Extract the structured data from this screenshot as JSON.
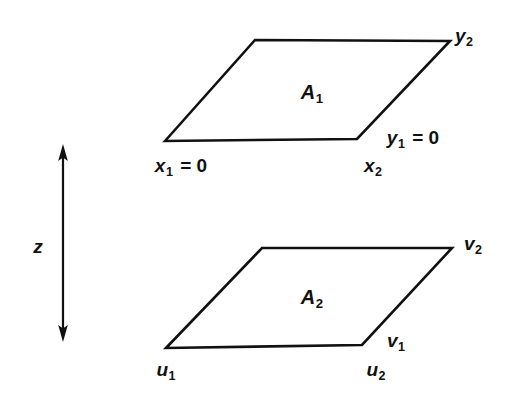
{
  "figure": {
    "type": "geometric-diagram",
    "background_color": "#ffffff",
    "stroke_color": "#111111",
    "text_color": "#111111"
  },
  "axis": {
    "name": "z",
    "label": "z",
    "style": "double-headed-vertical-arrow"
  },
  "planes": [
    {
      "id": "upper",
      "area_label": "A",
      "area_subscript": "1",
      "corner_labels": {
        "bottom_left": {
          "base": "x",
          "sub": "1",
          "suffix": " = 0"
        },
        "bottom_right": {
          "base": "x",
          "sub": "2",
          "suffix": ""
        },
        "right_edge": {
          "base": "y",
          "sub": "1",
          "suffix": " = 0"
        },
        "top_right": {
          "base": "y",
          "sub": "2",
          "suffix": ""
        }
      }
    },
    {
      "id": "lower",
      "area_label": "A",
      "area_subscript": "2",
      "corner_labels": {
        "bottom_left": {
          "base": "u",
          "sub": "1",
          "suffix": ""
        },
        "bottom_right": {
          "base": "u",
          "sub": "2",
          "suffix": ""
        },
        "right_edge": {
          "base": "v",
          "sub": "1",
          "suffix": ""
        },
        "top_right": {
          "base": "v",
          "sub": "2",
          "suffix": ""
        }
      }
    }
  ],
  "labels": {
    "a1_base": "A",
    "a1_sub": "1",
    "a2_base": "A",
    "a2_sub": "2",
    "x1_base": "x",
    "x1_sub": "1",
    "x1_suffix": " = 0",
    "x2_base": "x",
    "x2_sub": "2",
    "y1_base": "y",
    "y1_sub": "1",
    "y1_suffix": " = 0",
    "y2_base": "y",
    "y2_sub": "2",
    "u1_base": "u",
    "u1_sub": "1",
    "u2_base": "u",
    "u2_sub": "2",
    "v1_base": "v",
    "v1_sub": "1",
    "v2_base": "v",
    "v2_sub": "2",
    "z": "z"
  }
}
